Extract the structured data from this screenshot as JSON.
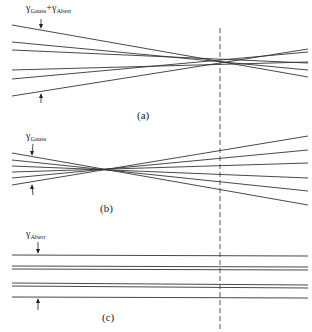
{
  "figure": {
    "background": "#ffffff",
    "line_color": "#333333",
    "dashed_line": {
      "x": 220,
      "y_top": 28,
      "y_bottom": 330
    },
    "panels": [
      {
        "id": "a",
        "caption": "(a)",
        "label": {
          "gamma": "γ",
          "sub1": "Gauss",
          "plus": "+",
          "gamma2": "γ",
          "sub2": "Aberr"
        },
        "description": "Rays converging with Gaussian spread plus aberration; crossing near the dashed plane",
        "rays": [
          {
            "x1": 12,
            "y1": 25,
            "x2": 308,
            "y2": 77
          },
          {
            "x1": 12,
            "y1": 42,
            "x2": 308,
            "y2": 70
          },
          {
            "x1": 12,
            "y1": 50,
            "x2": 308,
            "y2": 63
          },
          {
            "x1": 12,
            "y1": 70,
            "x2": 308,
            "y2": 62
          },
          {
            "x1": 12,
            "y1": 79,
            "x2": 308,
            "y2": 52
          },
          {
            "x1": 12,
            "y1": 96,
            "x2": 308,
            "y2": 49
          }
        ]
      },
      {
        "id": "b",
        "caption": "(b)",
        "label": {
          "gamma": "γ",
          "sub1": "Gauss"
        },
        "description": "Pure Gaussian rays focusing to a single point",
        "rays": [
          {
            "x1": 12,
            "y1": 153,
            "x2": 308,
            "y2": 205
          },
          {
            "x1": 12,
            "y1": 160,
            "x2": 308,
            "y2": 191
          },
          {
            "x1": 12,
            "y1": 166,
            "x2": 308,
            "y2": 178
          },
          {
            "x1": 12,
            "y1": 172,
            "x2": 308,
            "y2": 163
          },
          {
            "x1": 12,
            "y1": 178,
            "x2": 308,
            "y2": 150
          },
          {
            "x1": 12,
            "y1": 185,
            "x2": 308,
            "y2": 136
          }
        ]
      },
      {
        "id": "c",
        "caption": "(c)",
        "label": {
          "gamma": "γ",
          "sub1": "Aberr"
        },
        "description": "Aberration-only parallel rays",
        "rays": [
          {
            "x1": 12,
            "y1": 255,
            "x2": 308,
            "y2": 256
          },
          {
            "x1": 12,
            "y1": 266,
            "x2": 308,
            "y2": 267
          },
          {
            "x1": 12,
            "y1": 269,
            "x2": 308,
            "y2": 270
          },
          {
            "x1": 12,
            "y1": 283,
            "x2": 308,
            "y2": 285
          },
          {
            "x1": 12,
            "y1": 286,
            "x2": 308,
            "y2": 288
          },
          {
            "x1": 12,
            "y1": 297,
            "x2": 308,
            "y2": 298
          }
        ]
      }
    ]
  }
}
